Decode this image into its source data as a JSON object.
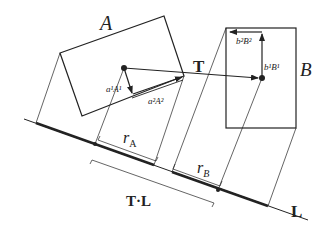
{
  "diagram": {
    "type": "separating-axis-projection",
    "labels": {
      "box_a": "A",
      "box_b": "B",
      "translation": "T",
      "axis": "L",
      "radius_a": "r",
      "radius_a_sub": "A",
      "radius_b": "r",
      "radius_b_sub": "B",
      "projection": "T·L",
      "a1_vec": "a¹A¹",
      "a2_vec": "a²A²",
      "b1_vec": "b¹B¹",
      "b2_vec": "b²B²"
    },
    "colors": {
      "stroke": "#222222",
      "background": "#ffffff"
    }
  }
}
